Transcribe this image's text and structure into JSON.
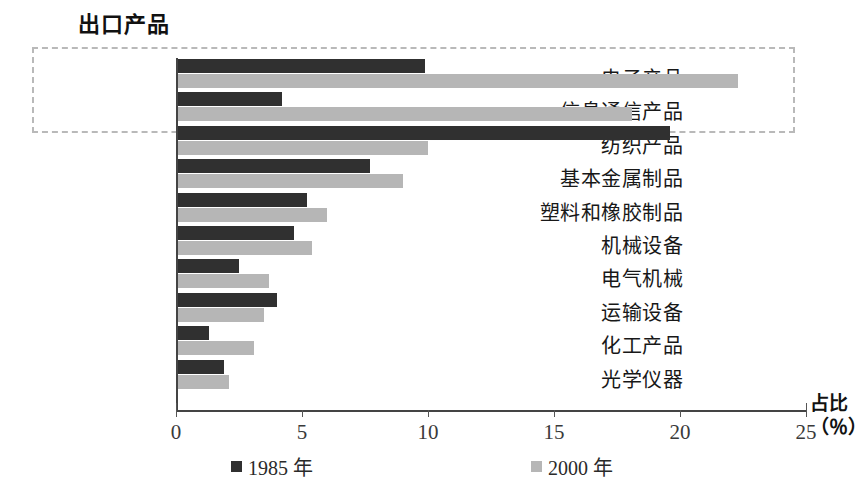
{
  "chart_title": "出口产品",
  "axis_title_line1": "占比",
  "axis_title_line2": "（％）",
  "legend": [
    {
      "label": "1985 年",
      "color": "#303030"
    },
    {
      "label": "2000 年",
      "color": "#b6b6b6"
    }
  ],
  "ticks": [
    "0",
    "5",
    "10",
    "15",
    "20",
    "25"
  ],
  "chart_data": {
    "type": "bar",
    "orientation": "horizontal",
    "title": "出口产品",
    "xlabel": "占比（％）",
    "ylabel": "",
    "xlim": [
      0,
      25
    ],
    "xticks": [
      0,
      5,
      10,
      15,
      20,
      25
    ],
    "grid": false,
    "legend_position": "bottom",
    "categories": [
      "电子产品",
      "信息通信产品",
      "纺织产品",
      "基本金属制品",
      "塑料和橡胶制品",
      "机械设备",
      "电气机械",
      "运输设备",
      "化工产品",
      "光学仪器"
    ],
    "series": [
      {
        "name": "1985 年",
        "color": "#303030",
        "values": [
          9.9,
          4.2,
          19.6,
          7.7,
          5.2,
          4.7,
          2.5,
          4.0,
          1.3,
          1.9
        ]
      },
      {
        "name": "2000 年",
        "color": "#b6b6b6",
        "values": [
          22.3,
          18.1,
          10.0,
          9.0,
          6.0,
          5.4,
          3.7,
          3.5,
          3.1,
          2.1
        ]
      }
    ],
    "annotations": [
      {
        "type": "highlight-box",
        "style": "dashed",
        "color": "#b9b9b9",
        "categories": [
          "电子产品",
          "信息通信产品"
        ]
      }
    ]
  }
}
